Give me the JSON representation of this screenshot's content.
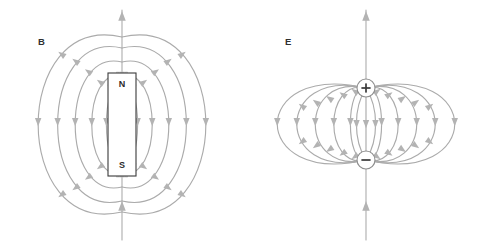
{
  "figure": {
    "background_color": "#ffffff",
    "field_line_color": "#ababab",
    "arrow_color": "#b3b3b3",
    "label_color": "#303030",
    "width": 488,
    "height": 248
  },
  "panels": [
    {
      "id": "magnetic",
      "label": "B",
      "label_x": 38,
      "label_y": 45,
      "kind": "bar-magnet-field",
      "center_x": 122,
      "source": {
        "type": "bar-magnet",
        "x": 108,
        "y": 73,
        "width": 28,
        "height": 103,
        "north_label": "N",
        "south_label": "S",
        "north_label_y": 87,
        "south_label_y": 168,
        "stroke": "#3a3a3a",
        "fill": "#ffffff"
      },
      "interior_lines": [
        -9,
        -5.5,
        -2,
        2,
        5.5,
        9
      ],
      "loops": [
        {
          "half_width": 16,
          "top_y": 84,
          "bottom_y": 165,
          "arrow_y": 122
        },
        {
          "half_width": 31,
          "top_y": 76,
          "bottom_y": 173,
          "arrow_y": 122
        },
        {
          "half_width": 48,
          "top_y": 62,
          "bottom_y": 187,
          "arrow_y": 122
        },
        {
          "half_width": 66,
          "top_y": 48,
          "bottom_y": 201,
          "arrow_y": 122
        },
        {
          "half_width": 86,
          "top_y": 37,
          "bottom_y": 212,
          "arrow_y": 122
        }
      ],
      "axis": {
        "top_start_y": 73,
        "top_end_y": 10,
        "bottom_start_y": 176,
        "bottom_end_y": 240,
        "top_arrow_y": 16,
        "bottom_arrow_y": 206,
        "direction": "up"
      }
    },
    {
      "id": "electric",
      "label": "E",
      "label_x": 41,
      "label_y": 45,
      "kind": "point-dipole-field",
      "center_x": 122,
      "source": {
        "type": "electric-dipole",
        "positive": {
          "glyph": "+",
          "cx": 122,
          "cy": 88,
          "r": 9
        },
        "negative": {
          "glyph": "−",
          "cx": 122,
          "cy": 160,
          "r": 9
        },
        "stroke": "#8f8f8f",
        "fill": "#ffffff"
      },
      "interior_lines": [
        -8,
        0,
        8
      ],
      "loops": [
        {
          "half_width": 16,
          "top_y": 88,
          "bottom_y": 160,
          "arrow_y": 122
        },
        {
          "half_width": 33,
          "top_y": 88,
          "bottom_y": 160,
          "arrow_y": 122
        },
        {
          "half_width": 52,
          "top_y": 88,
          "bottom_y": 160,
          "arrow_y": 122
        },
        {
          "half_width": 71,
          "top_y": 88,
          "bottom_y": 160,
          "arrow_y": 122
        },
        {
          "half_width": 91,
          "top_y": 88,
          "bottom_y": 160,
          "arrow_y": 122
        }
      ],
      "axis": {
        "top_start_y": 79,
        "top_end_y": 10,
        "bottom_start_y": 169,
        "bottom_end_y": 240,
        "top_arrow_y": 16,
        "bottom_arrow_y": 206,
        "direction": "up"
      }
    }
  ]
}
